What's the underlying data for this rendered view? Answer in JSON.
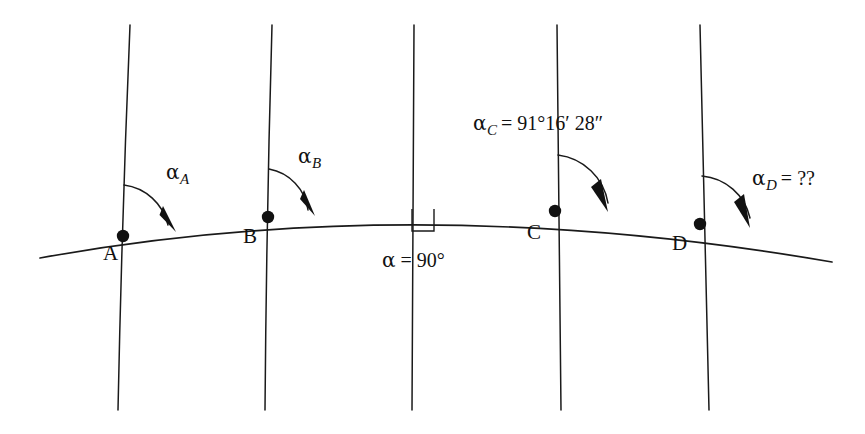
{
  "figure": {
    "type": "geodesy-meridian-convergence-diagram",
    "background_color": "#ffffff",
    "line_color": "#1a1a1a",
    "width": 865,
    "height": 434
  },
  "points": [
    {
      "id": "A",
      "label": "A",
      "x": 123,
      "y": 236,
      "label_x": 103,
      "label_y": 243
    },
    {
      "id": "B",
      "label": "B",
      "x": 268,
      "y": 217,
      "label_x": 243,
      "label_y": 226
    },
    {
      "id": "C",
      "label": "C",
      "x": 555,
      "y": 211,
      "label_x": 527,
      "label_y": 222
    },
    {
      "id": "D",
      "label": "D",
      "x": 700,
      "y": 224,
      "label_x": 672,
      "label_y": 233
    }
  ],
  "angles": [
    {
      "id": "alpha-A",
      "greek": "α",
      "subscript": "A",
      "value": "",
      "text": "αA",
      "label_x": 166,
      "label_y": 162
    },
    {
      "id": "alpha-B",
      "greek": "α",
      "subscript": "B",
      "value": "",
      "text": "αB",
      "label_x": 298,
      "label_y": 146
    },
    {
      "id": "alpha-C",
      "greek": "α",
      "subscript": "C",
      "value": "= 91°16′ 28″",
      "text": "αC = 91°16′ 28″",
      "label_x": 473,
      "label_y": 113
    },
    {
      "id": "alpha-D",
      "greek": "α",
      "subscript": "D",
      "value": "= ??",
      "text": "αD = ??",
      "label_x": 752,
      "label_y": 168
    }
  ],
  "right_angle": {
    "id": "alpha-90",
    "text": "α = 90°",
    "greek": "α",
    "value": "= 90°",
    "label_x": 382,
    "label_y": 250,
    "marker_x": 412,
    "marker_y": 220
  },
  "meridians": [
    {
      "id": "meridian-1",
      "top_x": 130,
      "top_y": 25,
      "bottom_x": 118,
      "bottom_y": 410
    },
    {
      "id": "meridian-2",
      "top_x": 272,
      "top_y": 25,
      "bottom_x": 265,
      "bottom_y": 410
    },
    {
      "id": "meridian-3",
      "top_x": 414,
      "top_y": 25,
      "bottom_x": 412,
      "bottom_y": 410
    },
    {
      "id": "meridian-4",
      "top_x": 557,
      "top_y": 25,
      "bottom_x": 561,
      "bottom_y": 410
    },
    {
      "id": "meridian-5",
      "top_x": 700,
      "top_y": 25,
      "bottom_x": 709,
      "bottom_y": 410
    }
  ],
  "geodesic": {
    "id": "geodesic-curve",
    "start_x": 40,
    "start_y": 258,
    "end_x": 832,
    "end_y": 262,
    "apex_x": 414,
    "apex_y": 209
  }
}
